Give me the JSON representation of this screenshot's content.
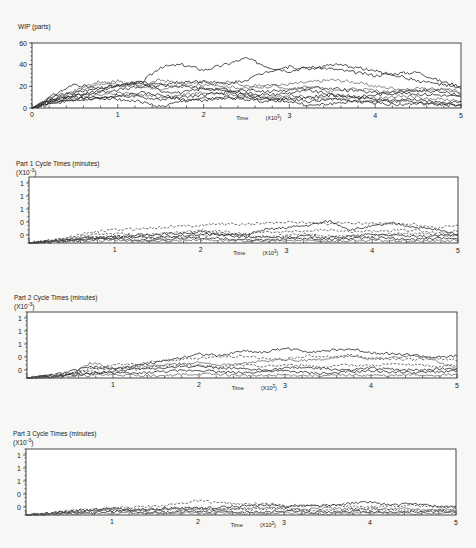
{
  "chart_data": [
    {
      "type": "line",
      "title": "WIP (parts)",
      "xlabel": "Time",
      "xlabel_multiplier": "(X10^3)",
      "ylabel": "WIP (parts)",
      "xlim": [
        0,
        5
      ],
      "ylim": [
        0,
        60
      ],
      "x_ticks": [
        "0",
        "1",
        "2",
        "3",
        "4",
        "5"
      ],
      "y_ticks": [
        "0",
        "20",
        "40",
        "60"
      ],
      "grid": false,
      "legend": "none",
      "note": "approx. 10 replication sample paths, values read from plot",
      "x": [
        0,
        0.25,
        0.5,
        0.75,
        1.0,
        1.25,
        1.5,
        1.75,
        2.0,
        2.25,
        2.5,
        2.75,
        3.0,
        3.25,
        3.5,
        3.75,
        4.0,
        4.25,
        4.5,
        4.75,
        5.0
      ],
      "series": [
        {
          "name": "run 1",
          "values": [
            0,
            10,
            14,
            18,
            21,
            22,
            38,
            40,
            35,
            40,
            46,
            38,
            34,
            38,
            36,
            33,
            30,
            32,
            33,
            25,
            20
          ]
        },
        {
          "name": "run 2",
          "values": [
            0,
            8,
            12,
            15,
            20,
            24,
            22,
            24,
            25,
            22,
            26,
            34,
            38,
            36,
            40,
            38,
            34,
            30,
            25,
            22,
            18
          ]
        },
        {
          "name": "run 3",
          "values": [
            0,
            6,
            16,
            24,
            22,
            20,
            26,
            22,
            24,
            20,
            18,
            20,
            22,
            24,
            26,
            24,
            20,
            18,
            16,
            18,
            15
          ]
        },
        {
          "name": "run 4",
          "values": [
            0,
            9,
            11,
            14,
            17,
            19,
            21,
            20,
            18,
            17,
            16,
            15,
            17,
            19,
            18,
            16,
            14,
            15,
            16,
            15,
            12
          ]
        },
        {
          "name": "run 5",
          "values": [
            0,
            12,
            22,
            18,
            20,
            24,
            16,
            14,
            18,
            16,
            14,
            12,
            14,
            16,
            12,
            10,
            12,
            14,
            13,
            12,
            10
          ]
        },
        {
          "name": "run 6",
          "values": [
            0,
            5,
            9,
            12,
            14,
            12,
            10,
            12,
            15,
            13,
            11,
            10,
            12,
            9,
            8,
            10,
            9,
            11,
            10,
            8,
            7
          ]
        },
        {
          "name": "run 7",
          "values": [
            0,
            7,
            10,
            8,
            12,
            10,
            8,
            10,
            12,
            14,
            12,
            9,
            8,
            6,
            8,
            7,
            6,
            8,
            7,
            5,
            6
          ]
        },
        {
          "name": "run 8",
          "values": [
            0,
            4,
            8,
            10,
            8,
            6,
            1,
            6,
            9,
            8,
            10,
            8,
            6,
            2,
            4,
            6,
            5,
            3,
            4,
            3,
            2
          ]
        },
        {
          "name": "run 9",
          "values": [
            0,
            11,
            15,
            21,
            25,
            20,
            18,
            20,
            21,
            24,
            20,
            22,
            18,
            20,
            15,
            18,
            16,
            14,
            18,
            17,
            14
          ]
        },
        {
          "name": "run 10",
          "values": [
            0,
            6,
            6,
            9,
            10,
            14,
            12,
            8,
            7,
            10,
            8,
            6,
            9,
            10,
            12,
            11,
            8,
            6,
            5,
            4,
            3
          ]
        }
      ]
    },
    {
      "type": "line",
      "title": "Part 1 Cycle Times (minutes)",
      "y_multiplier": "(X10^3)",
      "xlabel": "Time",
      "xlabel_multiplier": "(X10^3)",
      "xlim": [
        0,
        5
      ],
      "ylim": [
        0,
        1.5
      ],
      "x_ticks": [
        "1",
        "2",
        "3",
        "4",
        "5"
      ],
      "y_ticks": [
        "0",
        "0",
        "1",
        "1",
        "1"
      ],
      "grid": false,
      "legend": "none",
      "x": [
        0,
        0.25,
        0.5,
        0.75,
        1.0,
        1.25,
        1.5,
        1.75,
        2.0,
        2.25,
        2.5,
        2.75,
        3.0,
        3.25,
        3.5,
        3.75,
        4.0,
        4.25,
        4.5,
        4.75,
        5.0
      ],
      "series": [
        {
          "name": "run 1",
          "style": "dashed",
          "values": [
            0,
            0.05,
            0.15,
            0.25,
            0.3,
            0.32,
            0.35,
            0.38,
            0.4,
            0.44,
            0.42,
            0.45,
            0.48,
            0.46,
            0.44,
            0.46,
            0.45,
            0.44,
            0.42,
            0.35,
            0.4
          ]
        },
        {
          "name": "run 2",
          "values": [
            0,
            0.04,
            0.1,
            0.12,
            0.15,
            0.18,
            0.2,
            0.22,
            0.25,
            0.2,
            0.18,
            0.3,
            0.35,
            0.4,
            0.5,
            0.3,
            0.38,
            0.45,
            0.36,
            0.3,
            0.2
          ]
        },
        {
          "name": "run 3",
          "style": "dashed",
          "values": [
            0,
            0.06,
            0.12,
            0.2,
            0.22,
            0.18,
            0.2,
            0.24,
            0.3,
            0.26,
            0.2,
            0.24,
            0.26,
            0.28,
            0.3,
            0.25,
            0.26,
            0.28,
            0.3,
            0.22,
            0.28
          ]
        },
        {
          "name": "run 4",
          "values": [
            0,
            0.03,
            0.06,
            0.1,
            0.12,
            0.14,
            0.12,
            0.16,
            0.2,
            0.18,
            0.14,
            0.12,
            0.14,
            0.16,
            0.12,
            0.15,
            0.2,
            0.18,
            0.14,
            0.16,
            0.18
          ]
        },
        {
          "name": "run 5",
          "values": [
            0,
            0.02,
            0.05,
            0.08,
            0.1,
            0.08,
            0.06,
            0.1,
            0.12,
            0.1,
            0.08,
            0.06,
            0.09,
            0.1,
            0.08,
            0.1,
            0.12,
            0.1,
            0.08,
            0.1,
            0.12
          ]
        },
        {
          "name": "run 6",
          "values": [
            0,
            0.02,
            0.04,
            0.05,
            0.06,
            0.05,
            0.04,
            0.06,
            0.08,
            0.06,
            0.05,
            0.04,
            0.05,
            0.06,
            0.04,
            0.05,
            0.06,
            0.05,
            0.04,
            0.05,
            0.06
          ]
        },
        {
          "name": "run 7",
          "style": "dashed",
          "values": [
            0,
            0.03,
            0.08,
            0.14,
            0.16,
            0.12,
            0.1,
            0.14,
            0.16,
            0.22,
            0.16,
            0.14,
            0.18,
            0.2,
            0.16,
            0.14,
            0.16,
            0.2,
            0.22,
            0.18,
            0.16
          ]
        }
      ]
    },
    {
      "type": "line",
      "title": "Part 2 Cycle Times (minutes)",
      "y_multiplier": "(X10^3)",
      "xlabel": "Time",
      "xlabel_multiplier": "(X10^3)",
      "xlim": [
        0,
        5
      ],
      "ylim": [
        0,
        1.5
      ],
      "x_ticks": [
        "1",
        "2",
        "3",
        "4",
        "5"
      ],
      "y_ticks": [
        "0",
        "0",
        "1",
        "1",
        "1"
      ],
      "grid": false,
      "legend": "none",
      "x": [
        0,
        0.25,
        0.5,
        0.75,
        1.0,
        1.25,
        1.5,
        1.75,
        2.0,
        2.25,
        2.5,
        2.75,
        3.0,
        3.25,
        3.5,
        3.75,
        4.0,
        4.25,
        4.5,
        4.75,
        5.0
      ],
      "series": [
        {
          "name": "run 1",
          "values": [
            0,
            0.05,
            0.15,
            0.25,
            0.2,
            0.28,
            0.35,
            0.45,
            0.55,
            0.5,
            0.62,
            0.58,
            0.68,
            0.6,
            0.62,
            0.66,
            0.58,
            0.55,
            0.52,
            0.46,
            0.5
          ]
        },
        {
          "name": "run 2",
          "style": "dashed",
          "values": [
            0,
            0.06,
            0.12,
            0.2,
            0.3,
            0.32,
            0.38,
            0.42,
            0.45,
            0.48,
            0.5,
            0.45,
            0.42,
            0.5,
            0.48,
            0.52,
            0.46,
            0.44,
            0.42,
            0.45,
            0.4
          ]
        },
        {
          "name": "run 3",
          "values": [
            0,
            0.04,
            0.1,
            0.35,
            0.22,
            0.25,
            0.28,
            0.32,
            0.35,
            0.3,
            0.34,
            0.38,
            0.42,
            0.4,
            0.44,
            0.5,
            0.42,
            0.46,
            0.5,
            0.4,
            0.2
          ]
        },
        {
          "name": "run 4",
          "values": [
            0,
            0.03,
            0.08,
            0.12,
            0.15,
            0.2,
            0.22,
            0.25,
            0.28,
            0.22,
            0.2,
            0.18,
            0.22,
            0.24,
            0.2,
            0.18,
            0.22,
            0.2,
            0.18,
            0.2,
            0.22
          ]
        },
        {
          "name": "run 5",
          "values": [
            0,
            0.02,
            0.06,
            0.1,
            0.12,
            0.1,
            0.14,
            0.16,
            0.18,
            0.14,
            0.12,
            0.15,
            0.16,
            0.12,
            0.1,
            0.14,
            0.16,
            0.14,
            0.12,
            0.14,
            0.16
          ]
        },
        {
          "name": "run 6",
          "values": [
            0,
            0.02,
            0.04,
            0.06,
            0.08,
            0.06,
            0.05,
            0.07,
            0.09,
            0.08,
            0.06,
            0.05,
            0.07,
            0.06,
            0.05,
            0.07,
            0.06,
            0.05,
            0.07,
            0.06,
            0.08
          ]
        },
        {
          "name": "run 7",
          "style": "dashed",
          "values": [
            0,
            0.04,
            0.1,
            0.18,
            0.24,
            0.2,
            0.26,
            0.3,
            0.28,
            0.24,
            0.3,
            0.26,
            0.3,
            0.28,
            0.25,
            0.3,
            0.28,
            0.32,
            0.3,
            0.26,
            0.3
          ]
        }
      ]
    },
    {
      "type": "line",
      "title": "Part 3 Cycle Times (minutes)",
      "y_multiplier": "(X10^3)",
      "xlabel": "Time",
      "xlabel_multiplier": "(X10^3)",
      "xlim": [
        0,
        5
      ],
      "ylim": [
        0,
        1.5
      ],
      "x_ticks": [
        "1",
        "2",
        "3",
        "4",
        "5"
      ],
      "y_ticks": [
        "0",
        "0",
        "1",
        "1",
        "1"
      ],
      "grid": false,
      "legend": "none",
      "x": [
        0,
        0.25,
        0.5,
        0.75,
        1.0,
        1.25,
        1.5,
        1.75,
        2.0,
        2.25,
        2.5,
        2.75,
        3.0,
        3.25,
        3.5,
        3.75,
        4.0,
        4.25,
        4.5,
        4.75,
        5.0
      ],
      "series": [
        {
          "name": "run 1",
          "style": "dashed",
          "values": [
            0,
            0.04,
            0.1,
            0.14,
            0.16,
            0.18,
            0.2,
            0.25,
            0.32,
            0.28,
            0.24,
            0.26,
            0.22,
            0.2,
            0.22,
            0.2,
            0.18,
            0.2,
            0.22,
            0.18,
            0.2
          ]
        },
        {
          "name": "run 2",
          "values": [
            0,
            0.03,
            0.08,
            0.12,
            0.14,
            0.12,
            0.14,
            0.16,
            0.15,
            0.18,
            0.2,
            0.22,
            0.2,
            0.22,
            0.2,
            0.26,
            0.3,
            0.22,
            0.26,
            0.2,
            0.18
          ]
        },
        {
          "name": "run 3",
          "values": [
            0,
            0.02,
            0.06,
            0.1,
            0.12,
            0.1,
            0.12,
            0.14,
            0.12,
            0.1,
            0.14,
            0.16,
            0.14,
            0.12,
            0.16,
            0.14,
            0.12,
            0.15,
            0.14,
            0.12,
            0.14
          ]
        },
        {
          "name": "run 4",
          "values": [
            0,
            0.02,
            0.04,
            0.06,
            0.08,
            0.07,
            0.06,
            0.08,
            0.09,
            0.08,
            0.07,
            0.06,
            0.08,
            0.07,
            0.06,
            0.08,
            0.07,
            0.06,
            0.07,
            0.08,
            0.07
          ]
        },
        {
          "name": "run 5",
          "style": "dashed",
          "values": [
            0,
            0.03,
            0.07,
            0.11,
            0.1,
            0.12,
            0.14,
            0.12,
            0.16,
            0.14,
            0.12,
            0.14,
            0.16,
            0.12,
            0.1,
            0.12,
            0.14,
            0.12,
            0.1,
            0.12,
            0.1
          ]
        },
        {
          "name": "run 6",
          "values": [
            0,
            0.01,
            0.03,
            0.04,
            0.05,
            0.04,
            0.05,
            0.04,
            0.05,
            0.04,
            0.03,
            0.04,
            0.05,
            0.04,
            0.03,
            0.04,
            0.05,
            0.04,
            0.03,
            0.04,
            0.05
          ]
        }
      ]
    }
  ],
  "panels": [
    {
      "title": "WIP (parts)",
      "subtitle": "",
      "time_label": "Time",
      "multiplier_label": "(X10",
      "multiplier_exp": "3",
      "multiplier_close": ")"
    },
    {
      "title": "Part 1 Cycle Times (minutes)",
      "subtitle": "(X10",
      "subtitle_exp": "-3",
      "subtitle_close": ")",
      "time_label": "Time",
      "multiplier_label": "(X10",
      "multiplier_exp": "3",
      "multiplier_close": ")"
    },
    {
      "title": "Part 2 Cycle Times (minutes)",
      "subtitle": "(X10",
      "subtitle_exp": "-3",
      "subtitle_close": ")",
      "time_label": "Time",
      "multiplier_label": "(X10",
      "multiplier_exp": "3",
      "multiplier_close": ")"
    },
    {
      "title": "Part 3 Cycle Times (minutes)",
      "subtitle": "(X10",
      "subtitle_exp": "-3",
      "subtitle_close": ")",
      "time_label": "Time",
      "multiplier_label": "(X10",
      "multiplier_exp": "3",
      "multiplier_close": ")"
    }
  ]
}
